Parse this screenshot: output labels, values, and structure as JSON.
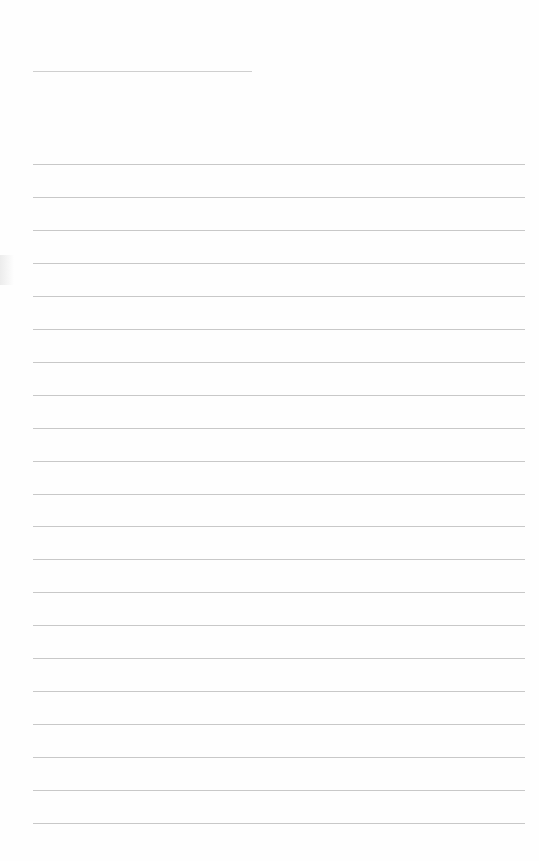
{
  "page": {
    "type": "lined-paper",
    "background": "#fefefe",
    "rule_color": "#c8c8c8",
    "header_rule": {
      "y": 71,
      "x_start": 33,
      "x_end": 252
    },
    "body_rules": {
      "count": 21,
      "y_start": 164,
      "spacing": 32.95,
      "x_start": 33,
      "x_end": 525
    },
    "text": []
  }
}
